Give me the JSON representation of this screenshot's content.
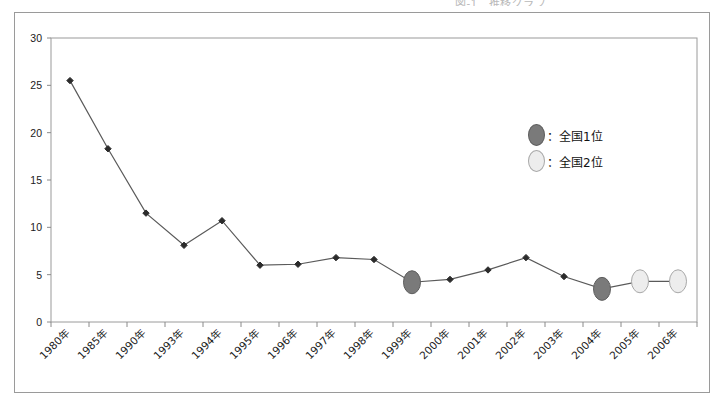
{
  "page": {
    "cut_off_header": "図-1　推移グラフ",
    "background": "#ffffff",
    "frame_color": "#9a9a9a"
  },
  "legend": {
    "position": "inside-right",
    "items": [
      {
        "name": "rank1",
        "label": "：全国1位",
        "color": "#7a7a7a",
        "border": "#5e5e5e"
      },
      {
        "name": "rank2",
        "label": "：全国2位",
        "color": "#ededed",
        "border": "#a8a8a8"
      }
    ]
  },
  "chart_data": {
    "type": "line",
    "title": "",
    "xlabel": "",
    "ylabel": "",
    "ylim": [
      0,
      30
    ],
    "yticks": [
      0,
      5,
      10,
      15,
      20,
      25,
      30
    ],
    "grid": false,
    "line_color": "#5a5a5a",
    "marker": "diamond",
    "marker_color": "#2b2b2b",
    "categories": [
      "1980年",
      "1985年",
      "1990年",
      "1993年",
      "1994年",
      "1995年",
      "1996年",
      "1997年",
      "1998年",
      "1999年",
      "2000年",
      "2001年",
      "2002年",
      "2003年",
      "2004年",
      "2005年",
      "2006年"
    ],
    "values": [
      25.5,
      18.3,
      11.5,
      8.1,
      10.7,
      6.0,
      6.1,
      6.8,
      6.6,
      4.2,
      4.5,
      5.5,
      6.8,
      4.8,
      3.5,
      4.3,
      4.3
    ],
    "highlights": [
      {
        "category": "1999年",
        "value": 4.2,
        "rank": "rank1"
      },
      {
        "category": "2004年",
        "value": 3.5,
        "rank": "rank1"
      },
      {
        "category": "2005年",
        "value": 4.3,
        "rank": "rank2"
      },
      {
        "category": "2006年",
        "value": 4.3,
        "rank": "rank2"
      }
    ]
  }
}
